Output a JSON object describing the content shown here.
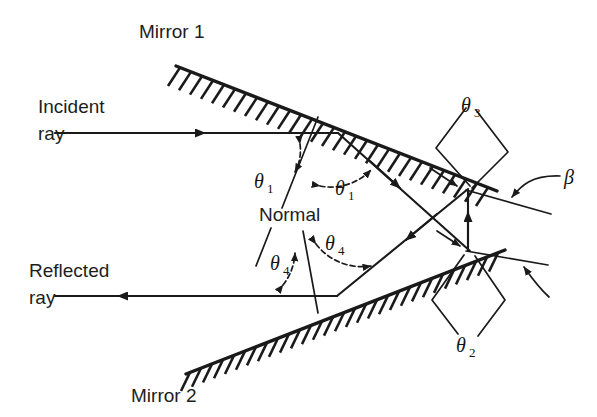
{
  "figure": {
    "background": "#ffffff",
    "ink": "#1a1a1a"
  },
  "labels": {
    "mirror1": "Mirror 1",
    "mirror2": "Mirror 2",
    "incident_ray_line1": "Incident",
    "incident_ray_line2": "ray",
    "reflected_ray_line1": "Reflected",
    "reflected_ray_line2": "ray",
    "normal": "Normal"
  },
  "angles": {
    "theta1_left": {
      "symbol": "θ",
      "subscript": "1"
    },
    "theta1_right": {
      "symbol": "θ",
      "subscript": "1"
    },
    "theta4_left": {
      "symbol": "θ",
      "subscript": "4"
    },
    "theta4_right": {
      "symbol": "θ",
      "subscript": "4"
    },
    "theta3": {
      "symbol": "θ",
      "subscript": "3"
    },
    "theta2": {
      "symbol": "θ",
      "subscript": "2"
    },
    "beta": {
      "symbol": "β",
      "subscript": ""
    }
  },
  "geometry": {
    "mirror1": {
      "x1": 176,
      "y1": 66,
      "x2": 497,
      "y2": 191,
      "hatch_side": "below"
    },
    "mirror2": {
      "x1": 186,
      "y1": 374,
      "x2": 505,
      "y2": 250,
      "hatch_side": "below"
    },
    "incident_ray": {
      "from_x": 55,
      "from_y": 133,
      "to_x": 338,
      "to_y": 133
    },
    "reflected_ray": {
      "from_x": 337,
      "from_y": 296,
      "to_x": 55,
      "to_y": 296
    },
    "reflection_point_m1": {
      "x": 338,
      "y": 133
    },
    "reflection_point_m2": {
      "x": 337,
      "y": 296
    },
    "vertex_upper": {
      "x": 468,
      "y": 190
    },
    "vertex_lower": {
      "x": 468,
      "y": 250
    },
    "normal_m1": {
      "x1": 316,
      "y1": 118,
      "x2": 268,
      "y2": 236
    },
    "normal_m2": {
      "x1": 318,
      "y1": 312,
      "x2": 300,
      "y2": 232
    }
  }
}
